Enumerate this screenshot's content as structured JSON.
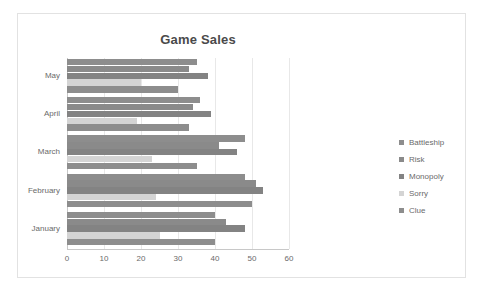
{
  "chart_data": {
    "type": "bar",
    "orientation": "horizontal",
    "title": "Game Sales",
    "xlabel": "",
    "ylabel": "",
    "xlim": [
      0,
      60
    ],
    "xticks": [
      0,
      10,
      20,
      30,
      40,
      50,
      60
    ],
    "grid": true,
    "legend_position": "right",
    "categories": [
      "January",
      "February",
      "March",
      "April",
      "May"
    ],
    "category_order_top_to_bottom": [
      "May",
      "April",
      "March",
      "February",
      "January"
    ],
    "series": [
      {
        "name": "Battleship",
        "color": "#8d8d8d",
        "values": [
          40,
          48,
          48,
          36,
          35
        ]
      },
      {
        "name": "Risk",
        "color": "#8a8a8a",
        "values": [
          43,
          51,
          41,
          34,
          33
        ]
      },
      {
        "name": "Monopoly",
        "color": "#838383",
        "values": [
          48,
          53,
          46,
          39,
          38
        ]
      },
      {
        "name": "Sorry",
        "color": "#d4d4d4",
        "values": [
          25,
          24,
          23,
          19,
          20
        ]
      },
      {
        "name": "Clue",
        "color": "#8d8d8d",
        "values": [
          40,
          50,
          35,
          33,
          30
        ]
      }
    ]
  },
  "legend": {
    "items": [
      {
        "label": "Battleship",
        "color": "#8d8d8d"
      },
      {
        "label": "Risk",
        "color": "#8a8a8a"
      },
      {
        "label": "Monopoly",
        "color": "#838383"
      },
      {
        "label": "Sorry",
        "color": "#d4d4d4"
      },
      {
        "label": "Clue",
        "color": "#8d8d8d"
      }
    ]
  }
}
